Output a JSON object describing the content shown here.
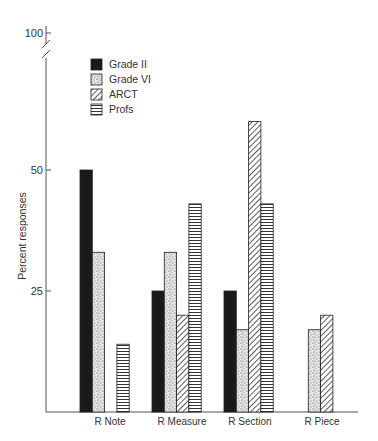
{
  "chart_data": {
    "type": "bar",
    "title": "",
    "xlabel": "",
    "ylabel": "Percent responses",
    "ylim": [
      0,
      100
    ],
    "axis_break": true,
    "y_ticks": [
      25,
      50,
      100
    ],
    "grid": false,
    "legend_position": "upper-left inside",
    "categories": [
      "R  Note",
      "R  Measure",
      "R Section",
      "R Piece"
    ],
    "series": [
      {
        "name": "Grade II",
        "pattern": "solid-black",
        "values": [
          50,
          25,
          25,
          0
        ]
      },
      {
        "name": "Grade VI",
        "pattern": "stipple",
        "values": [
          33,
          33,
          17,
          17
        ]
      },
      {
        "name": "ARCT",
        "pattern": "diagonal-hatch",
        "values": [
          0,
          20,
          60,
          20
        ]
      },
      {
        "name": "Profs",
        "pattern": "horizontal-lines",
        "values": [
          14,
          43,
          43,
          0
        ]
      }
    ]
  },
  "colors": {
    "ink": "#1a1a1a",
    "axis": "#555555",
    "background": "#ffffff"
  }
}
